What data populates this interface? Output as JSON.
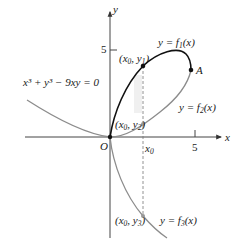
{
  "figure": {
    "equation": "x³ + y³ − 9xy = 0",
    "axes": {
      "x_label": "x",
      "y_label": "y",
      "origin_label": "O",
      "x_tick_label": "5",
      "y_tick_label": "5",
      "x0_label": "x",
      "x0_sub": "0"
    },
    "curves": {
      "f1": {
        "label_prefix": "y = f",
        "sub": "1",
        "suffix": "(x)",
        "color": "#111111"
      },
      "f2": {
        "label_prefix": "y = f",
        "sub": "2",
        "suffix": "(x)",
        "color": "#8c8c8c"
      },
      "f3": {
        "label_prefix": "y = f",
        "sub": "3",
        "suffix": "(x)",
        "color": "#8c8c8c"
      }
    },
    "points": {
      "p1": {
        "open": "(x",
        "s1": "0",
        "mid": ", y",
        "s2": "1",
        "close": ")"
      },
      "p2": {
        "open": "(x",
        "s1": "0",
        "mid": ", y",
        "s2": "2",
        "close": ")"
      },
      "p3": {
        "open": "(x",
        "s1": "0",
        "mid": ", y",
        "s2": "3",
        "close": ")"
      },
      "A": "A"
    }
  }
}
